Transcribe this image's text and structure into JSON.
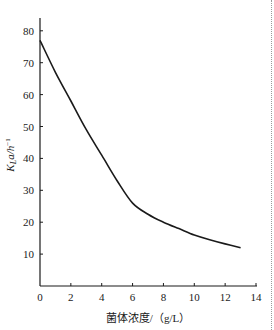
{
  "chart_data": {
    "type": "line",
    "title": "",
    "xlabel": "菌体浓度/（g/L）",
    "ylabel": "K_La/h⁻¹",
    "ylabel_parts": {
      "k": "K",
      "sub": "L",
      "rest": "a/h",
      "sup": "−1"
    },
    "xlim": [
      0,
      14
    ],
    "ylim": [
      0,
      85
    ],
    "x_ticks": [
      0,
      2,
      4,
      6,
      8,
      10,
      12,
      14
    ],
    "y_ticks": [
      10,
      20,
      30,
      40,
      50,
      60,
      70,
      80
    ],
    "grid": false,
    "legend": null,
    "series": [
      {
        "name": "KLa",
        "x": [
          0,
          1,
          2,
          3,
          4,
          5,
          6,
          7,
          8,
          9,
          10,
          11,
          12,
          13
        ],
        "values": [
          77,
          67,
          58,
          49,
          41,
          33,
          26,
          22.5,
          20,
          18,
          16,
          14.5,
          13.2,
          12
        ]
      }
    ]
  },
  "labels": {
    "x_title": "菌体浓度/（g/L）"
  },
  "colors": {
    "line": "#1a1a1a",
    "axis": "#1a1a1a",
    "background": "#ffffff"
  }
}
